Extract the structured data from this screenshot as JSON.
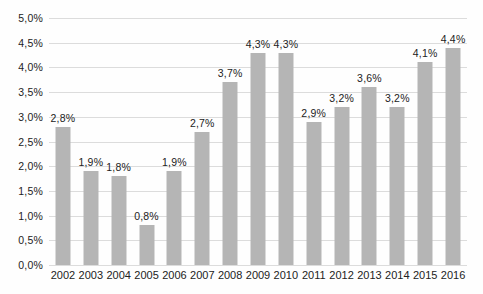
{
  "chart_data": {
    "type": "bar",
    "title": "",
    "xlabel": "",
    "ylabel": "",
    "categories": [
      "2002",
      "2003",
      "2004",
      "2005",
      "2006",
      "2007",
      "2008",
      "2009",
      "2010",
      "2011",
      "2012",
      "2013",
      "2014",
      "2015",
      "2016"
    ],
    "values": [
      2.8,
      1.9,
      1.8,
      0.8,
      1.9,
      2.7,
      3.7,
      4.3,
      4.3,
      2.9,
      3.2,
      3.6,
      3.2,
      4.1,
      4.4
    ],
    "value_labels": [
      "2,8%",
      "1,9%",
      "1,8%",
      "0,8%",
      "1,9%",
      "2,7%",
      "3,7%",
      "4,3%",
      "4,3%",
      "2,9%",
      "3,2%",
      "3,6%",
      "3,2%",
      "4,1%",
      "4,4%"
    ],
    "ylim": [
      0,
      5
    ],
    "ytick_step": 0.5,
    "ytick_labels": [
      "0,0%",
      "0,5%",
      "1,0%",
      "1,5%",
      "2,0%",
      "2,5%",
      "3,0%",
      "3,5%",
      "4,0%",
      "4,5%",
      "5,0%"
    ],
    "grid": true,
    "legend": "none",
    "colors": {
      "bar": "#b5b5b5",
      "gridline": "#dcdcdc",
      "text": "#222222"
    },
    "layout": {
      "bar_width_px": 15,
      "plot_height_px": 247,
      "plot_width_px": 418
    }
  }
}
